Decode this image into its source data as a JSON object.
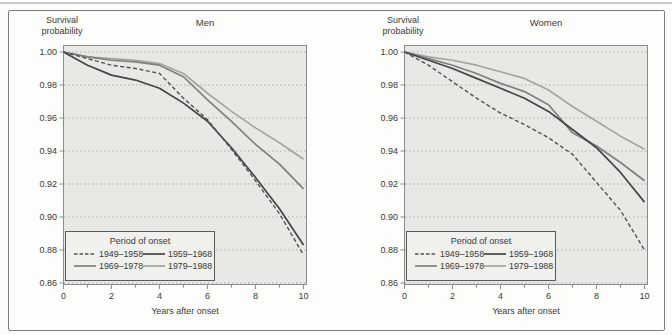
{
  "page": {
    "kind": "two-panel survival curve figure",
    "colors": {
      "plot_bg": "#e8e8e5",
      "plot_border": "#8b8b89",
      "grid": "#adada8",
      "text": "#3a3a3a",
      "legend_bg": "#f0f0ed",
      "legend_border": "#5a5a58",
      "top_rule": "#cdcdc7"
    }
  },
  "chart_data": [
    {
      "type": "line",
      "title": "Men",
      "ylabel_lines": [
        "Survival",
        "probability"
      ],
      "xlabel": "Years after onset",
      "legend_title": "Period of onset",
      "legend_position": "lower left",
      "grid": "horizontal dotted",
      "x": [
        0,
        1,
        2,
        3,
        4,
        5,
        6,
        7,
        8,
        9,
        10
      ],
      "xticks": [
        0,
        2,
        4,
        6,
        8,
        10
      ],
      "ytick_labels": [
        "1.00",
        "0.98",
        "0.96",
        "0.94",
        "0.92",
        "0.90",
        "0.88",
        "0.86"
      ],
      "xlim": [
        0,
        10
      ],
      "ylim": [
        0.86,
        1.0
      ],
      "series": [
        {
          "name": "1949–1958",
          "style": "dashed",
          "color": "#525250",
          "values": [
            1.0,
            0.996,
            0.992,
            0.99,
            0.987,
            0.972,
            0.959,
            0.941,
            0.922,
            0.902,
            0.877
          ]
        },
        {
          "name": "1959–1968",
          "style": "solid",
          "color": "#454543",
          "values": [
            1.0,
            0.992,
            0.986,
            0.983,
            0.978,
            0.969,
            0.958,
            0.942,
            0.924,
            0.905,
            0.883
          ]
        },
        {
          "name": "1969–1978",
          "style": "solid",
          "color": "#7e827d",
          "values": [
            1.0,
            0.997,
            0.995,
            0.994,
            0.992,
            0.985,
            0.971,
            0.958,
            0.944,
            0.932,
            0.917
          ]
        },
        {
          "name": "1979–1988",
          "style": "solid",
          "color": "#a2a69f",
          "values": [
            1.0,
            0.997,
            0.996,
            0.995,
            0.993,
            0.987,
            0.975,
            0.964,
            0.954,
            0.945,
            0.935
          ]
        }
      ]
    },
    {
      "type": "line",
      "title": "Women",
      "ylabel_lines": [
        "Survival",
        "probability"
      ],
      "xlabel": "Years after onset",
      "legend_title": "Period of onset",
      "legend_position": "lower left",
      "grid": "horizontal dotted",
      "x": [
        0,
        1,
        2,
        3,
        4,
        5,
        6,
        7,
        8,
        9,
        10
      ],
      "xticks": [
        0,
        2,
        4,
        6,
        8,
        10
      ],
      "ytick_labels": [
        "1.00",
        "0.98",
        "0.96",
        "0.94",
        "0.92",
        "0.90",
        "0.88",
        "0.86"
      ],
      "xlim": [
        0,
        10
      ],
      "ylim": [
        0.86,
        1.0
      ],
      "series": [
        {
          "name": "1949–1958",
          "style": "dashed",
          "color": "#525250",
          "values": [
            1.0,
            0.992,
            0.982,
            0.972,
            0.963,
            0.956,
            0.948,
            0.938,
            0.921,
            0.904,
            0.88
          ]
        },
        {
          "name": "1959–1968",
          "style": "solid",
          "color": "#454543",
          "values": [
            1.0,
            0.995,
            0.99,
            0.984,
            0.978,
            0.972,
            0.964,
            0.953,
            0.942,
            0.927,
            0.909
          ]
        },
        {
          "name": "1969–1978",
          "style": "solid",
          "color": "#7e827d",
          "values": [
            1.0,
            0.996,
            0.992,
            0.987,
            0.981,
            0.976,
            0.968,
            0.951,
            0.943,
            0.933,
            0.922
          ]
        },
        {
          "name": "1979–1988",
          "style": "solid",
          "color": "#a2a69f",
          "values": [
            1.0,
            0.997,
            0.995,
            0.992,
            0.988,
            0.984,
            0.977,
            0.967,
            0.958,
            0.949,
            0.941
          ]
        }
      ]
    }
  ]
}
